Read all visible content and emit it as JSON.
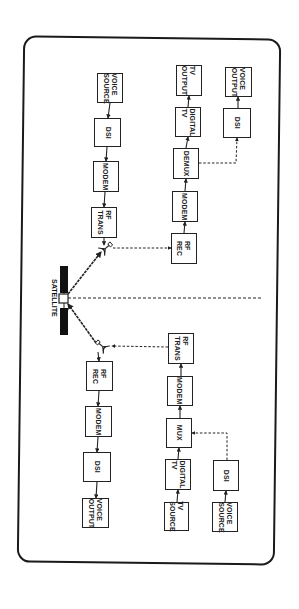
{
  "figure": {
    "satellite_label": "SATELLITE",
    "colors": {
      "ink": "#222222",
      "background": "#ffffff"
    },
    "blocks": [
      {
        "id": "l-voice-source",
        "label": "VOICE\nSOURCE",
        "x": 97,
        "y": 73,
        "w": 26,
        "h": 30
      },
      {
        "id": "l-dsi-1",
        "label": "DSI",
        "x": 94,
        "y": 118,
        "w": 27,
        "h": 29
      },
      {
        "id": "l-modem-1",
        "label": "MODEM",
        "x": 93,
        "y": 161,
        "w": 26,
        "h": 31
      },
      {
        "id": "l-rf-trans",
        "label": "RF\nTRANS",
        "x": 91,
        "y": 207,
        "w": 26,
        "h": 31
      },
      {
        "id": "r-tv-output",
        "label": "TV\nOUTPUT",
        "x": 176,
        "y": 65,
        "w": 26,
        "h": 31
      },
      {
        "id": "r-digital-tv-1",
        "label": "DIGITAL\nTV",
        "x": 175,
        "y": 107,
        "w": 26,
        "h": 30
      },
      {
        "id": "r-demux",
        "label": "DEMUX",
        "x": 173,
        "y": 148,
        "w": 26,
        "h": 31
      },
      {
        "id": "r-modem-1",
        "label": "MODEM",
        "x": 172,
        "y": 191,
        "w": 26,
        "h": 31
      },
      {
        "id": "r-rf-rec",
        "label": "RF\nREC",
        "x": 171,
        "y": 233,
        "w": 26,
        "h": 31
      },
      {
        "id": "r-voice-output",
        "label": "VOICE\nOUTPUT",
        "x": 225,
        "y": 67,
        "w": 27,
        "h": 30
      },
      {
        "id": "r-dsi-1",
        "label": "DSI",
        "x": 223,
        "y": 108,
        "w": 28,
        "h": 30
      },
      {
        "id": "l-rf-rec",
        "label": "RF\nREC",
        "x": 86,
        "y": 361,
        "w": 27,
        "h": 30
      },
      {
        "id": "l-modem-2",
        "label": "MODEM",
        "x": 85,
        "y": 406,
        "w": 27,
        "h": 31
      },
      {
        "id": "l-dsi-2",
        "label": "DSI",
        "x": 83,
        "y": 452,
        "w": 28,
        "h": 30
      },
      {
        "id": "l-voice-output",
        "label": "VOICE\nOUTPUT",
        "x": 82,
        "y": 498,
        "w": 27,
        "h": 30
      },
      {
        "id": "r-rf-trans",
        "label": "RF\nTRANS",
        "x": 168,
        "y": 333,
        "w": 26,
        "h": 31
      },
      {
        "id": "r-modem-2",
        "label": "MODEM",
        "x": 167,
        "y": 376,
        "w": 26,
        "h": 30
      },
      {
        "id": "r-mux",
        "label": "MUX",
        "x": 166,
        "y": 418,
        "w": 26,
        "h": 30
      },
      {
        "id": "r-digital-tv-2",
        "label": "DIGITAL\nTV",
        "x": 165,
        "y": 459,
        "w": 26,
        "h": 31
      },
      {
        "id": "r-tv-source",
        "label": "TV\nSOURCE",
        "x": 164,
        "y": 502,
        "w": 25,
        "h": 29
      },
      {
        "id": "r-dsi-2",
        "label": "DSI",
        "x": 213,
        "y": 460,
        "w": 26,
        "h": 31
      },
      {
        "id": "r-voice-source",
        "label": "VOICE\nSOURCE",
        "x": 212,
        "y": 502,
        "w": 26,
        "h": 30
      }
    ],
    "arrows_solid": [
      [
        110,
        103,
        108,
        118
      ],
      [
        107,
        147,
        106,
        161
      ],
      [
        105,
        192,
        104,
        207
      ],
      [
        104,
        238,
        104,
        245
      ],
      [
        189,
        96,
        189,
        96
      ],
      [
        188,
        107,
        189,
        96
      ],
      [
        186,
        148,
        188,
        137
      ],
      [
        185,
        191,
        186,
        179
      ],
      [
        184,
        233,
        185,
        222
      ],
      [
        238,
        108,
        238,
        97
      ],
      [
        98,
        352,
        99,
        361
      ],
      [
        99,
        391,
        98,
        406
      ],
      [
        98,
        437,
        97,
        452
      ],
      [
        97,
        482,
        96,
        498
      ],
      [
        181,
        376,
        181,
        364
      ],
      [
        180,
        418,
        180,
        406
      ],
      [
        178,
        459,
        179,
        448
      ],
      [
        177,
        502,
        178,
        490
      ],
      [
        225,
        502,
        226,
        491
      ]
    ],
    "arrows_dashed": [
      {
        "points": [
          [
            113,
            248
          ],
          [
            171,
            248
          ]
        ]
      },
      {
        "points": [
          [
            168,
            347
          ],
          [
            112,
            346
          ]
        ]
      },
      {
        "points": [
          [
            199,
            163
          ],
          [
            236,
            163
          ],
          [
            237,
            138
          ]
        ]
      },
      {
        "points": [
          [
            227,
            460
          ],
          [
            227,
            433
          ],
          [
            192,
            433
          ]
        ]
      }
    ],
    "dashed_divider": [
      [
        68,
        298
      ],
      [
        262,
        298
      ]
    ],
    "satellite": {
      "body": {
        "x": 59,
        "y": 294,
        "w": 9,
        "h": 9
      },
      "panel_top": {
        "x": 60,
        "y": 266,
        "w": 8,
        "h": 27
      },
      "panel_bottom": {
        "x": 60,
        "y": 308,
        "w": 8,
        "h": 27
      },
      "link_up": [
        [
          68,
          294
        ],
        [
          101,
          252
        ]
      ],
      "link_down": [
        [
          68,
          304
        ],
        [
          96,
          343
        ]
      ]
    },
    "antennas": [
      {
        "id": "antenna-top",
        "x": 106,
        "y": 248,
        "rot": -40
      },
      {
        "id": "antenna-bottom",
        "x": 102,
        "y": 346,
        "rot": 220
      }
    ]
  }
}
